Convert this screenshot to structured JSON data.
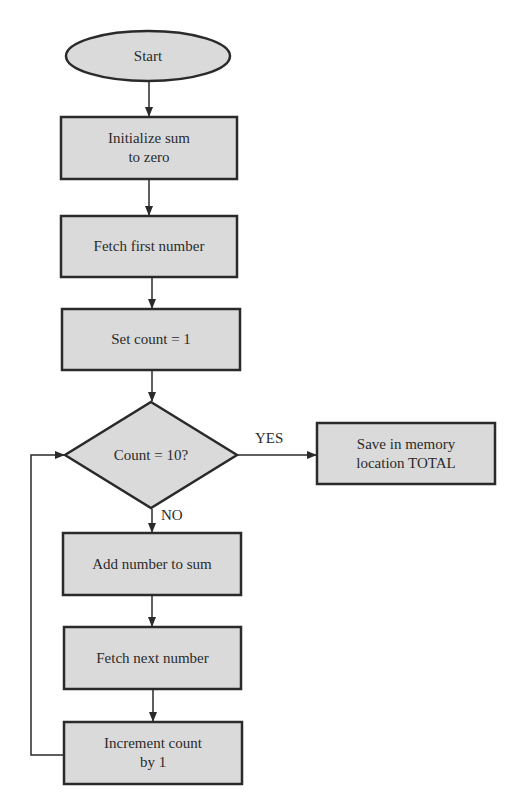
{
  "flowchart": {
    "colors": {
      "fill": "#dadada",
      "stroke": "#2a2a2a",
      "text": "#2b2b2b"
    },
    "nodes": {
      "start": {
        "type": "terminator",
        "label": "Start"
      },
      "init": {
        "type": "process",
        "label": "Initialize sum\nto zero"
      },
      "fetch_first": {
        "type": "process",
        "label": "Fetch first number"
      },
      "set_count": {
        "type": "process",
        "label": "Set count = 1"
      },
      "decision": {
        "type": "decision",
        "label": "Count = 10?"
      },
      "save": {
        "type": "process",
        "label": "Save in memory\nlocation TOTAL"
      },
      "add": {
        "type": "process",
        "label": "Add number to sum"
      },
      "fetch_next": {
        "type": "process",
        "label": "Fetch next number"
      },
      "increment": {
        "type": "process",
        "label": "Increment count\nby 1"
      }
    },
    "edge_labels": {
      "yes": "YES",
      "no": "NO"
    },
    "edges": [
      [
        "start",
        "init"
      ],
      [
        "init",
        "fetch_first"
      ],
      [
        "fetch_first",
        "set_count"
      ],
      [
        "set_count",
        "decision"
      ],
      [
        "decision",
        "save",
        "YES"
      ],
      [
        "decision",
        "add",
        "NO"
      ],
      [
        "add",
        "fetch_next"
      ],
      [
        "fetch_next",
        "increment"
      ],
      [
        "increment",
        "decision"
      ]
    ]
  }
}
